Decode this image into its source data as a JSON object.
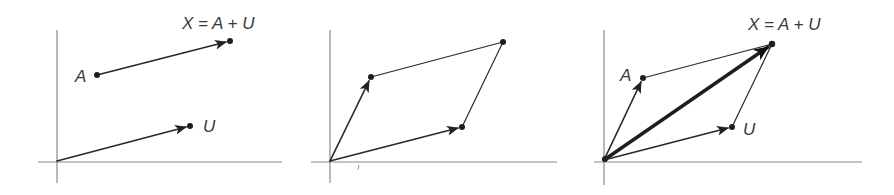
{
  "figure": {
    "colors": {
      "axis": "#8a8a8a",
      "ink": "#2a2a2a",
      "label": "#3a3a3a"
    },
    "panels": [
      {
        "id": "panel-1",
        "title": "translated vector",
        "origin": [
          57,
          161
        ],
        "points": {
          "A": [
            97,
            75
          ],
          "U": [
            190,
            126
          ],
          "X": [
            230,
            41
          ]
        },
        "labels": {
          "A": "A",
          "U": "U",
          "X": "X = A + U"
        }
      },
      {
        "id": "panel-2",
        "title": "parallelogram",
        "origin": [
          330,
          161
        ],
        "points": {
          "A": [
            371,
            77
          ],
          "U": [
            462,
            127
          ],
          "X": [
            503,
            42
          ]
        },
        "labels": {}
      },
      {
        "id": "panel-3",
        "title": "diagonal sum",
        "origin": [
          604,
          160
        ],
        "points": {
          "A": [
            643,
            78
          ],
          "U": [
            732,
            127
          ],
          "X": [
            772,
            44
          ]
        },
        "labels": {
          "A": "A",
          "U": "U",
          "X": "X = A + U"
        }
      }
    ]
  }
}
